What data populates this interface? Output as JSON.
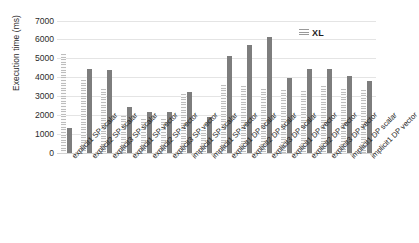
{
  "chart_data": {
    "type": "bar",
    "title": "",
    "xlabel": "",
    "ylabel": "Execution time (ms)",
    "ylim": [
      0,
      7000
    ],
    "ytick_values": [
      7000,
      6000,
      5000,
      4000,
      3000,
      2000,
      1000,
      0
    ],
    "ytick_labels": [
      "7000",
      "6000",
      "5000",
      "4000",
      "3000",
      "2000",
      "1000",
      "0"
    ],
    "grid": true,
    "legend_position": "top-right",
    "legend": [
      "XL"
    ],
    "categories": [
      "explicit1 SP scalar",
      "explicit2 SP scalar",
      "explicit3 SP scalar",
      "explicit1 SP vector",
      "explicit2 SP vector",
      "explicit3 SP vector",
      "implicit1 SP scalar",
      "implicit1 SP vector",
      "explicit1 DP scalar",
      "explicit2 DP scalar",
      "explicit3 DP scalar",
      "explicit1 DP vector",
      "explicit2 DP vector",
      "explicit3 DP vector",
      "implicit1 DP scalar",
      "implicit1 DP vector"
    ],
    "series": [
      {
        "name": "XL",
        "style": "hatched",
        "color": "#d9d9d9",
        "values": [
          5200,
          3850,
          3350,
          1950,
          1780,
          1780,
          3080,
          1200,
          3600,
          3550,
          3350,
          3300,
          3250,
          3550,
          3350,
          3300
        ]
      },
      {
        "name": "series-2",
        "style": "solid",
        "color": "#7d7d7d",
        "values": [
          1300,
          4450,
          4380,
          2420,
          2160,
          2160,
          3200,
          1880,
          5100,
          5700,
          6100,
          3950,
          4450,
          4420,
          4050,
          3800
        ]
      }
    ]
  },
  "legend": {
    "label": "XL",
    "swatch_name": "hatched-swatch"
  },
  "axes": {
    "y_title": "Execution time (ms)"
  }
}
